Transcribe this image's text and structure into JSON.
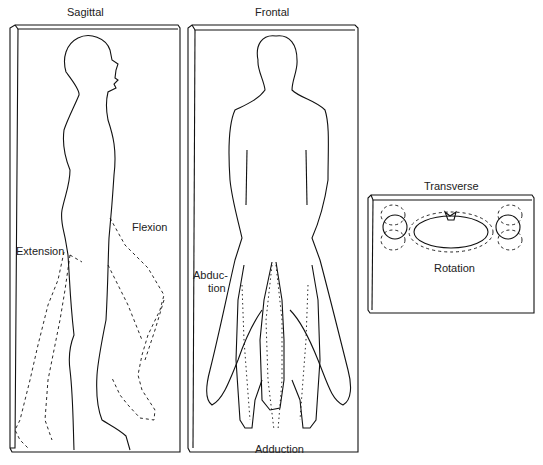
{
  "panels": {
    "sagittal": {
      "title": "Sagittal",
      "labels": {
        "flexion": "Flexion",
        "extension": "Extension"
      }
    },
    "frontal": {
      "title": "Frontal",
      "labels": {
        "abduction_line1": "Abduc-",
        "abduction_line2": "tion",
        "adduction": "Adduction"
      }
    },
    "transverse": {
      "title": "Transverse",
      "labels": {
        "rotation": "Rotation"
      }
    }
  },
  "colors": {
    "line": "#111111",
    "background": "#ffffff"
  }
}
